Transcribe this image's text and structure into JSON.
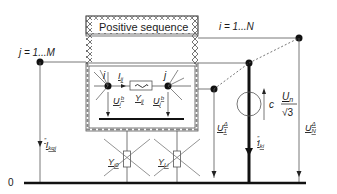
{
  "diagram": {
    "title_box": "Positive sequence",
    "labels": {
      "node_j_range": "j = 1...M",
      "node_i_range": "i = 1...N",
      "ground": "0",
      "node_i": "i",
      "node_j": "j",
      "current_ij": "I",
      "current_ij_sub": "ij",
      "admittance_ij": "Y",
      "admittance_ij_sub": "ij",
      "voltage_ib": "U",
      "voltage_ib_sub": "i",
      "voltage_ib_sup": "b",
      "voltage_jb": "U",
      "voltage_jb_sub": "j",
      "voltage_jb_sup": "b",
      "source_c": "c",
      "source_num": "U",
      "source_num_sub": "n",
      "source_den": "√3",
      "voltage_1": "U",
      "voltage_1_sub": "1",
      "voltage_1_sup": "Δ",
      "voltage_N": "U",
      "voltage_N_sub": "N",
      "voltage_N_sup": "Δ",
      "current_kqj": "I",
      "current_kqj_sub": "kqj",
      "current_kqj_sup": "″",
      "current_ki": "I",
      "current_ki_sub": "ki",
      "current_ki_sup": "″",
      "shunt_i0": "Y",
      "shunt_i0_sub": "i0",
      "shunt_li": "Y",
      "shunt_li_sub": "Li"
    },
    "colors": {
      "line": "#555555",
      "heavy": "#111111",
      "hatch": "#777777"
    }
  }
}
